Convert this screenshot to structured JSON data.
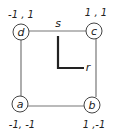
{
  "diagram": {
    "type": "square-element-natural-coordinates",
    "colors": {
      "edge": "#777777",
      "axis": "#222222",
      "text": "#222222",
      "background": "#ffffff"
    },
    "nodes": [
      {
        "id": "a",
        "label": "a",
        "coords": "-1, -1",
        "cx": 20,
        "cy": 104
      },
      {
        "id": "b",
        "label": "b",
        "coords": "1 ,-1",
        "cx": 92,
        "cy": 105
      },
      {
        "id": "c",
        "label": "c",
        "coords": "1 , 1",
        "cx": 94,
        "cy": 31
      },
      {
        "id": "d",
        "label": "d",
        "coords": "-1 , 1",
        "cx": 21,
        "cy": 32
      }
    ],
    "edges": [
      {
        "from": "d",
        "to": "c"
      },
      {
        "from": "c",
        "to": "b"
      },
      {
        "from": "b",
        "to": "a"
      },
      {
        "from": "a",
        "to": "d"
      }
    ],
    "axes": {
      "s_label": "s",
      "r_label": "r"
    }
  }
}
